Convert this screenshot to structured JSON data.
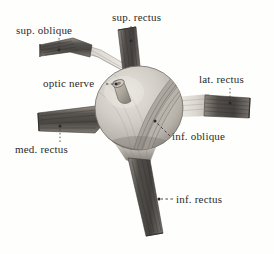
{
  "figure": {
    "style": "grayscale anatomical engraving",
    "background_color": "#fefefd",
    "ink_color": "#2a2a2a",
    "labels": [
      {
        "id": "sup-oblique",
        "text": "sup. oblique",
        "leader": "dotted-down"
      },
      {
        "id": "sup-rectus",
        "text": "sup. rectus",
        "leader": "dotted-down"
      },
      {
        "id": "optic-nerve",
        "text": "optic nerve",
        "leader": "dashed-right"
      },
      {
        "id": "lat-rectus",
        "text": "lat. rectus",
        "leader": "dotted-down"
      },
      {
        "id": "med-rectus",
        "text": "med. rectus",
        "leader": "dotted-up"
      },
      {
        "id": "inf-oblique",
        "text": "inf. oblique",
        "leader": "dashed-up-left"
      },
      {
        "id": "inf-rectus",
        "text": "inf. rectus",
        "leader": "dashed-left"
      }
    ],
    "structures": [
      {
        "id": "eyeball",
        "name": "eyeball globe"
      },
      {
        "id": "optic-nerve",
        "name": "optic nerve stump"
      },
      {
        "id": "sup-oblique",
        "name": "superior oblique muscle"
      },
      {
        "id": "sup-rectus",
        "name": "superior rectus muscle"
      },
      {
        "id": "lat-rectus",
        "name": "lateral rectus muscle"
      },
      {
        "id": "med-rectus",
        "name": "medial rectus muscle"
      },
      {
        "id": "inf-rectus",
        "name": "inferior rectus muscle"
      },
      {
        "id": "inf-oblique",
        "name": "inferior oblique muscle"
      }
    ]
  }
}
